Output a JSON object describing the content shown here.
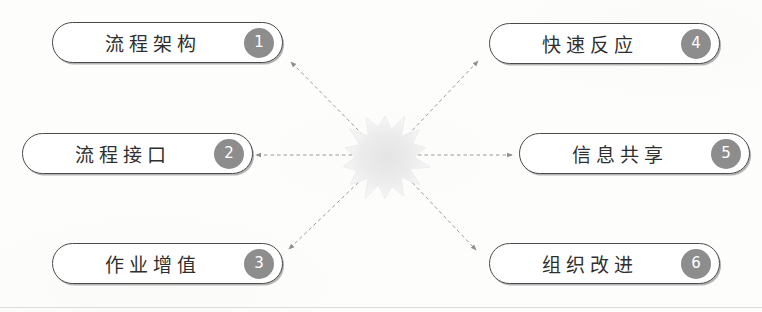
{
  "diagram": {
    "type": "radial-starburst",
    "center": {
      "icon": "starburst-explosion-shape",
      "label": ""
    },
    "nodes": [
      {
        "id": "node-1",
        "label": "流程架构",
        "number": "1",
        "column": "left",
        "row": 1,
        "x": 52,
        "y": 22,
        "w": 231,
        "h": 41
      },
      {
        "id": "node-2",
        "label": "流程接口",
        "number": "2",
        "column": "left",
        "row": 2,
        "x": 22,
        "y": 133,
        "w": 231,
        "h": 41
      },
      {
        "id": "node-3",
        "label": "作业增值",
        "number": "3",
        "column": "left",
        "row": 3,
        "x": 52,
        "y": 243,
        "w": 231,
        "h": 41
      },
      {
        "id": "node-4",
        "label": "快速反应",
        "number": "4",
        "column": "right",
        "row": 1,
        "x": 489,
        "y": 23,
        "w": 231,
        "h": 41
      },
      {
        "id": "node-5",
        "label": "信息共享",
        "number": "5",
        "column": "right",
        "row": 2,
        "x": 519,
        "y": 133,
        "w": 231,
        "h": 41
      },
      {
        "id": "node-6",
        "label": "组织改进",
        "number": "6",
        "column": "right",
        "row": 3,
        "x": 489,
        "y": 243,
        "w": 231,
        "h": 41
      }
    ],
    "connectors": [
      {
        "id": "connector-to-node-1",
        "from": "center",
        "to": "node-1",
        "style": "dashed",
        "arrow": "end",
        "x1": 363,
        "y1": 135,
        "x2": 291,
        "y2": 62
      },
      {
        "id": "connector-to-node-2",
        "from": "center",
        "to": "node-2",
        "style": "dashed",
        "arrow": "end",
        "x1": 352,
        "y1": 155,
        "x2": 256,
        "y2": 155
      },
      {
        "id": "connector-to-node-3",
        "from": "center",
        "to": "node-3",
        "style": "dashed",
        "arrow": "end",
        "x1": 363,
        "y1": 178,
        "x2": 289,
        "y2": 249
      },
      {
        "id": "connector-to-node-4",
        "from": "center",
        "to": "node-4",
        "style": "dashed",
        "arrow": "end",
        "x1": 408,
        "y1": 135,
        "x2": 478,
        "y2": 61
      },
      {
        "id": "connector-to-node-5",
        "from": "center",
        "to": "node-5",
        "style": "dashed",
        "arrow": "end",
        "x1": 418,
        "y1": 155,
        "x2": 512,
        "y2": 155
      },
      {
        "id": "connector-to-node-6",
        "from": "center",
        "to": "node-6",
        "style": "dashed",
        "arrow": "end",
        "x1": 408,
        "y1": 178,
        "x2": 476,
        "y2": 250
      }
    ],
    "colors": {
      "node_border": "#4a4a4a",
      "node_fill": "#ffffff",
      "badge_fill": "#8d8d8d",
      "badge_text": "#ffffff",
      "label_text": "#2f2f2f",
      "connector": "#9a9a9a",
      "burst_fill": "#eeeeee",
      "page_background": "#fdfdfc"
    }
  }
}
